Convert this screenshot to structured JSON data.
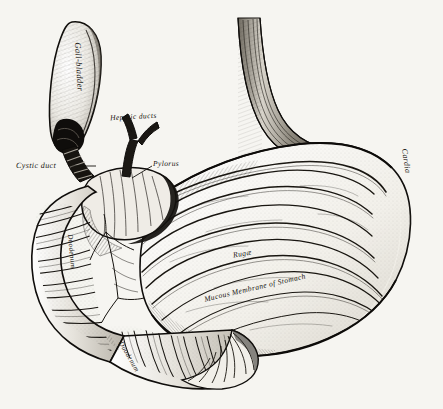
{
  "figure": {
    "title": "Stomach and duodenum, interior view",
    "background_color": "#f6f5f1",
    "ink_color": "#15130f",
    "style": "steel engraving / line-and-stipple anatomical plate"
  },
  "labels": {
    "gall_bladder": "Gall-bladder",
    "hepatic_ducts": "Hepatic ducts",
    "cystic_duct": "Cystic duct",
    "pylorus": "Pylorus",
    "cardia": "Cardia",
    "rugae": "Rugæ",
    "mucous_membrane": "Mucous Membrane of Stomach",
    "duodenum": "Duodenum",
    "duodenum_lower": "Duodenum"
  },
  "structures": [
    {
      "name": "gall-bladder",
      "region": "upper-left",
      "description": "pear-shaped sac, shaded outline, neck narrowing to duct"
    },
    {
      "name": "cystic-duct",
      "region": "left-of-pylorus",
      "description": "short banded/valved duct below gall-bladder neck"
    },
    {
      "name": "hepatic-ducts",
      "region": "upper-center-left",
      "description": "Y-shaped forked ducts joining the common duct"
    },
    {
      "name": "pylorus",
      "region": "center-left",
      "description": "muscular ring between stomach and duodenum"
    },
    {
      "name": "oesophagus",
      "region": "top-center-right",
      "description": "tube entering stomach, longitudinal striations"
    },
    {
      "name": "cardia",
      "region": "right",
      "description": "cardiac orifice region of stomach, right curvature"
    },
    {
      "name": "stomach-interior",
      "region": "center-right",
      "description": "opened stomach showing concentric wavy rugae"
    },
    {
      "name": "duodenum",
      "region": "left-and-bottom",
      "description": "C-shaped loop with transverse ribbed folds, cut fan-shaped end at lower right"
    }
  ]
}
